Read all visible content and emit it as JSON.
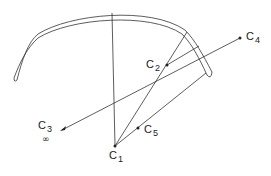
{
  "diagram": {
    "stroke_color": "#333333",
    "points": {
      "C1": {
        "label": "C",
        "sub": "1",
        "x": 115,
        "y": 146
      },
      "C2": {
        "label": "C",
        "sub": "2",
        "x": 167,
        "y": 65
      },
      "C3": {
        "label": "C",
        "sub": "3",
        "x": 62,
        "y": 130,
        "note": "∞"
      },
      "C4": {
        "label": "C",
        "sub": "4",
        "x": 240,
        "y": 38
      },
      "C5": {
        "label": "C",
        "sub": "5",
        "x": 138,
        "y": 128
      }
    }
  }
}
